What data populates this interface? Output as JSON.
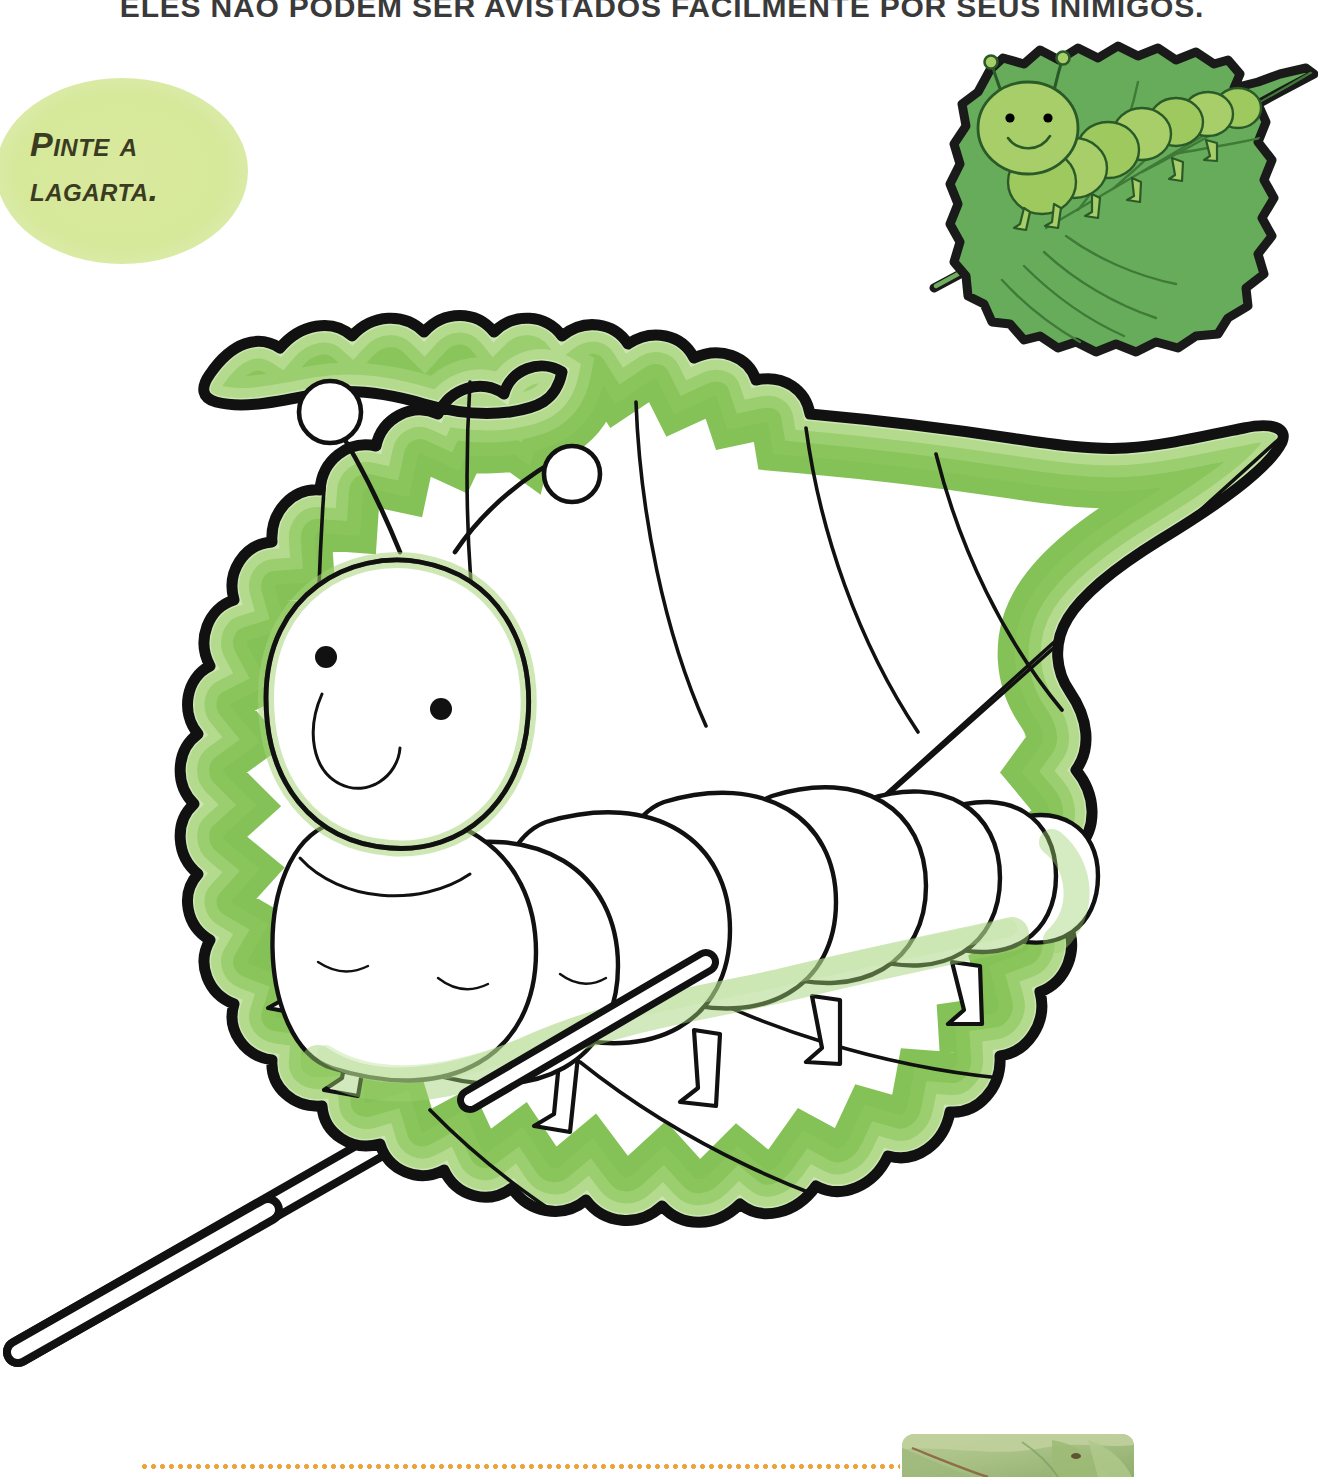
{
  "page": {
    "width": 1324,
    "height": 1477,
    "background_color": "#ffffff",
    "document_type": "childrens-coloring-worksheet",
    "language": "pt-BR"
  },
  "header": {
    "instruction_text": "ELES NÃO PODEM SER AVISTADOS FACILMENTE POR SEUS INIMIGOS.",
    "text_color": "#3a3a3a"
  },
  "prompt_bubble": {
    "line1": "Pinte a",
    "line2": "lagarta.",
    "oval_color": "#d6e89a",
    "text_color": "#3b3b22"
  },
  "reference_illustration": {
    "label": "colored-reference-caterpillar-on-leaf",
    "leaf_color": "#67ac5a",
    "leaf_shadow_color": "#55974a",
    "caterpillar_body_color": "#a8ce6a",
    "caterpillar_highlight_color": "#bcd97f",
    "outline_color": "#1a1a1a",
    "eye_color": "#000000",
    "segment_count": 8,
    "leg_count": 6,
    "antenna_count": 2
  },
  "coloring_illustration": {
    "label": "uncolored-caterpillar-on-leaf-line-art",
    "fill_color": "#ffffff",
    "outline_color": "#111111",
    "airbrush_green": "#7dbe4e",
    "airbrush_green_light": "#a6d379",
    "leaf_outline_width_px": 11,
    "caterpillar_segment_count": 8,
    "caterpillar_leg_count": 6,
    "antenna_count": 2,
    "leaf_vein_count": 9,
    "has_stem": true
  },
  "footer": {
    "dotted_rule_color": "#eda23a",
    "photo_label": "green-leaves-photograph",
    "photo_colors": [
      "#a9c186",
      "#c3d2a0",
      "#8fae6c",
      "#7d9e5c"
    ]
  }
}
